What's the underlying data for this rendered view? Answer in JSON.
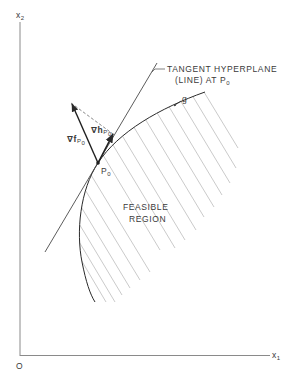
{
  "figure": {
    "axes": {
      "y_label": "x",
      "y_label_sub": "2",
      "x_label": "x",
      "x_label_sub": "1",
      "origin_label": "O"
    },
    "labels": {
      "tangent_line1": "TANGENT HYPERPLANE",
      "tangent_line2": "(LINE) AT P",
      "tangent_line2_sub": "0",
      "constraint": "g",
      "point": "P",
      "point_sub": "0",
      "grad_f": "∇f",
      "grad_f_sub": "P",
      "grad_f_subsub": "0",
      "grad_h": "∇h",
      "grad_h_sub": "P",
      "grad_h_subsub": "0",
      "region_line1": "FEASIBLE",
      "region_line2": "REGION"
    },
    "colors": {
      "ink": "#2a2a2a",
      "hatch": "#b8b8b8",
      "axis": "#8a8a8a"
    }
  }
}
